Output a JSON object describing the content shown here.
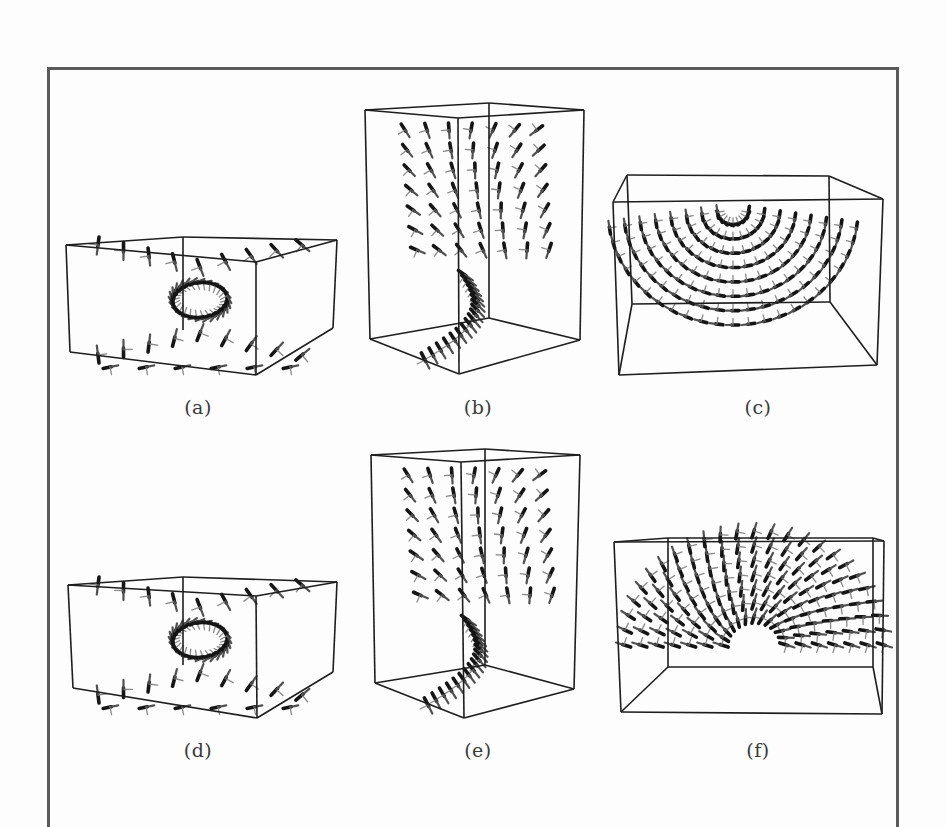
{
  "figure": {
    "panels": [
      {
        "id": "a",
        "label": "(a)",
        "label_pos": [
          198,
          397
        ],
        "box": {
          "front": [
            [
              66,
              245
            ],
            [
              256,
              262
            ],
            [
              256,
              375
            ],
            [
              70,
              352
            ]
          ],
          "back": [
            [
              183,
              237
            ],
            [
              337,
              240
            ],
            [
              333,
              328
            ],
            [
              183,
              325
            ]
          ],
          "edges": [
            [
              [
                66,
                245
              ],
              [
                183,
                237
              ]
            ],
            [
              [
                183,
                237
              ],
              [
                337,
                240
              ]
            ],
            [
              [
                337,
                240
              ],
              [
                256,
                262
              ]
            ],
            [
              [
                256,
                262
              ],
              [
                66,
                245
              ]
            ],
            [
              [
                66,
                245
              ],
              [
                70,
                352
              ]
            ],
            [
              [
                256,
                262
              ],
              [
                256,
                375
              ]
            ],
            [
              [
                337,
                240
              ],
              [
                333,
                328
              ]
            ],
            [
              [
                70,
                352
              ],
              [
                256,
                375
              ]
            ],
            [
              [
                256,
                375
              ],
              [
                333,
                328
              ]
            ],
            [
              [
                183,
                237
              ],
              [
                183,
                330
              ]
            ]
          ]
        },
        "glyphs": {
          "pattern": "hourglass",
          "cx": 200,
          "cy": 300,
          "rx": 120,
          "ry": 55,
          "n": 44
        }
      },
      {
        "id": "b",
        "label": "(b)",
        "label_pos": [
          478,
          397
        ],
        "box": {
          "edges": [
            [
              [
                365,
                110
              ],
              [
                489,
                103
              ]
            ],
            [
              [
                489,
                103
              ],
              [
                584,
                110
              ]
            ],
            [
              [
                584,
                110
              ],
              [
                458,
                118
              ]
            ],
            [
              [
                458,
                118
              ],
              [
                365,
                110
              ]
            ],
            [
              [
                365,
                110
              ],
              [
                370,
                339
              ]
            ],
            [
              [
                458,
                118
              ],
              [
                459,
                374
              ]
            ],
            [
              [
                584,
                110
              ],
              [
                580,
                340
              ]
            ],
            [
              [
                370,
                339
              ],
              [
                459,
                374
              ]
            ],
            [
              [
                459,
                374
              ],
              [
                580,
                340
              ]
            ],
            [
              [
                489,
                103
              ],
              [
                489,
                318
              ]
            ],
            [
              [
                370,
                339
              ],
              [
                489,
                318
              ]
            ],
            [
              [
                489,
                318
              ],
              [
                580,
                340
              ]
            ]
          ]
        },
        "glyphs": {
          "pattern": "twist",
          "cx": 475,
          "cy": 235,
          "rx": 75,
          "ry": 120,
          "n": 60
        }
      },
      {
        "id": "c",
        "label": "(c)",
        "label_pos": [
          758,
          397
        ],
        "box": {
          "edges": [
            [
              [
                627,
                175
              ],
              [
                829,
                176
              ]
            ],
            [
              [
                627,
                175
              ],
              [
                632,
                304
              ]
            ],
            [
              [
                829,
                176
              ],
              [
                830,
                302
              ]
            ],
            [
              [
                632,
                304
              ],
              [
                830,
                302
              ]
            ],
            [
              [
                613,
                202
              ],
              [
                883,
                199
              ]
            ],
            [
              [
                613,
                202
              ],
              [
                619,
                375
              ]
            ],
            [
              [
                883,
                199
              ],
              [
                877,
                365
              ]
            ],
            [
              [
                619,
                375
              ],
              [
                877,
                365
              ]
            ],
            [
              [
                627,
                175
              ],
              [
                613,
                202
              ]
            ],
            [
              [
                829,
                176
              ],
              [
                883,
                199
              ]
            ],
            [
              [
                632,
                304
              ],
              [
                619,
                375
              ]
            ],
            [
              [
                830,
                302
              ],
              [
                877,
                365
              ]
            ]
          ]
        },
        "glyphs": {
          "pattern": "bowl",
          "cx": 733,
          "cy": 230,
          "rx": 125,
          "ry": 100,
          "n": 80
        }
      },
      {
        "id": "d",
        "label": "(d)",
        "label_pos": [
          198,
          740
        ],
        "box": {
          "edges": [
            [
              [
                68,
                585
              ],
              [
                183,
                577
              ]
            ],
            [
              [
                183,
                577
              ],
              [
                337,
                582
              ]
            ],
            [
              [
                337,
                582
              ],
              [
                256,
                596
              ]
            ],
            [
              [
                256,
                596
              ],
              [
                68,
                585
              ]
            ],
            [
              [
                68,
                585
              ],
              [
                73,
                688
              ]
            ],
            [
              [
                256,
                596
              ],
              [
                257,
                718
              ]
            ],
            [
              [
                337,
                582
              ],
              [
                333,
                672
              ]
            ],
            [
              [
                73,
                688
              ],
              [
                257,
                718
              ]
            ],
            [
              [
                257,
                718
              ],
              [
                333,
                672
              ]
            ],
            [
              [
                183,
                577
              ],
              [
                183,
                665
              ]
            ]
          ]
        },
        "glyphs": {
          "pattern": "hourglass",
          "cx": 200,
          "cy": 640,
          "rx": 120,
          "ry": 55,
          "n": 44
        }
      },
      {
        "id": "e",
        "label": "(e)",
        "label_pos": [
          478,
          740
        ],
        "box": {
          "edges": [
            [
              [
                371,
                455
              ],
              [
                485,
                449
              ]
            ],
            [
              [
                485,
                449
              ],
              [
                580,
                455
              ]
            ],
            [
              [
                580,
                455
              ],
              [
                461,
                462
              ]
            ],
            [
              [
                461,
                462
              ],
              [
                371,
                455
              ]
            ],
            [
              [
                371,
                455
              ],
              [
                375,
                683
              ]
            ],
            [
              [
                461,
                462
              ],
              [
                464,
                718
              ]
            ],
            [
              [
                580,
                455
              ],
              [
                574,
                689
              ]
            ],
            [
              [
                375,
                683
              ],
              [
                464,
                718
              ]
            ],
            [
              [
                464,
                718
              ],
              [
                574,
                689
              ]
            ],
            [
              [
                485,
                449
              ],
              [
                485,
                665
              ]
            ],
            [
              [
                375,
                683
              ],
              [
                485,
                665
              ]
            ],
            [
              [
                485,
                665
              ],
              [
                574,
                689
              ]
            ]
          ]
        },
        "glyphs": {
          "pattern": "twist",
          "cx": 478,
          "cy": 580,
          "rx": 75,
          "ry": 120,
          "n": 60
        }
      },
      {
        "id": "f",
        "label": "(f)",
        "label_pos": [
          758,
          740
        ],
        "box": {
          "edges": [
            [
              [
                614,
                542
              ],
              [
                884,
                541
              ]
            ],
            [
              [
                614,
                542
              ],
              [
                621,
                712
              ]
            ],
            [
              [
                884,
                541
              ],
              [
                882,
                714
              ]
            ],
            [
              [
                621,
                712
              ],
              [
                882,
                714
              ]
            ],
            [
              [
                668,
                538
              ],
              [
                873,
                538
              ]
            ],
            [
              [
                668,
                538
              ],
              [
                668,
                667
              ]
            ],
            [
              [
                873,
                538
              ],
              [
                873,
                667
              ]
            ],
            [
              [
                668,
                667
              ],
              [
                873,
                667
              ]
            ],
            [
              [
                614,
                542
              ],
              [
                668,
                538
              ]
            ],
            [
              [
                884,
                541
              ],
              [
                873,
                538
              ]
            ],
            [
              [
                621,
                712
              ],
              [
                668,
                667
              ]
            ],
            [
              [
                882,
                714
              ],
              [
                873,
                667
              ]
            ]
          ]
        },
        "glyphs": {
          "pattern": "arch",
          "cx": 754,
          "cy": 665,
          "rx": 130,
          "ry": 120,
          "n": 90
        }
      }
    ],
    "colors": {
      "frame": "#5a5a5a",
      "box_line": "#1e1e1e",
      "glyph_dark": "#151515",
      "glyph_light": "#8a8a8a",
      "background": "#fdfdfd"
    }
  }
}
